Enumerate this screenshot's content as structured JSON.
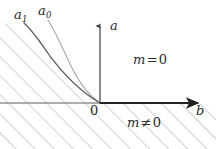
{
  "figure": {
    "background_color": "#ffffff",
    "width": 216,
    "height": 149
  },
  "axes": {
    "horizontal": {
      "name": "b-axis",
      "label": "b",
      "color": "#222222",
      "origin_x": 100,
      "y": 103,
      "x_start": 0,
      "x_end": 205,
      "arrow": "right"
    },
    "vertical": {
      "name": "a-axis",
      "label": "a",
      "color": "#3a3a3a",
      "x": 100,
      "y_start": 22,
      "y_end": 103,
      "arrow": "up"
    },
    "origin_label": "0"
  },
  "curves": [
    {
      "id": "a1",
      "label": "a",
      "subscript": "1",
      "color": "#5a5a5a",
      "stroke_width": 1.2,
      "description": "inner boundary curve, hyperbola-like, descends from upper-left and approaches the origin asymptotically"
    },
    {
      "id": "a0",
      "label": "a",
      "subscript": "0",
      "color": "#a8a8a8",
      "stroke_width": 1.1,
      "description": "outer boundary curve, lighter gray, descends from upper-left and approaches the origin asymptotically"
    }
  ],
  "regions": [
    {
      "id": "m-zero",
      "label_text": "m",
      "operator": "=",
      "value": "0",
      "full_label": "m = 0",
      "hatched": false,
      "description": "unhatched white region to the right of the curves and above the b-axis"
    },
    {
      "id": "m-nonzero",
      "label_text": "m",
      "operator": "≠",
      "value": "0",
      "full_label": "m ≠ 0",
      "hatched": true,
      "description": "hatched region: left of the a1 curve in the second quadrant and everything below the b-axis"
    }
  ],
  "hatching": {
    "color": "#9a9a9a",
    "stroke_width": 0.9,
    "angle_degrees": 45,
    "direction": "up-to-the-right",
    "spacing_px": 13.5
  },
  "colors": {
    "ink": "#2b2b2b",
    "axis": "#222222",
    "curve_inner": "#5a5a5a",
    "curve_outer": "#a8a8a8",
    "hatch": "#9a9a9a",
    "background": "#ffffff"
  }
}
